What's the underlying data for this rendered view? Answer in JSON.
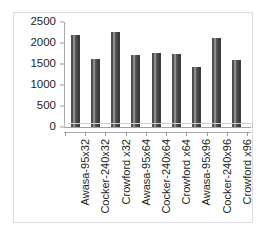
{
  "title_remnant": "",
  "chart_data": {
    "type": "bar",
    "title": "",
    "xlabel": "",
    "ylabel": "",
    "ylim": [
      0,
      2500
    ],
    "yticks": [
      0,
      500,
      1000,
      1500,
      2000,
      2500
    ],
    "ytick_labels": [
      "0",
      "500",
      "1000",
      "1500",
      "2000",
      "2500"
    ],
    "grid": false,
    "legend": "none",
    "bar_color": "#4f4f4f",
    "categories": [
      "Awasa-95x32",
      "Cocker-240x32",
      "Crowford x32",
      "Awasa-95x64",
      "Cocker-240x64",
      "Crowford x64",
      "Awasa-95x96",
      "Cocker-240x96",
      "Crowford x96"
    ],
    "values": [
      2180,
      1620,
      2260,
      1720,
      1760,
      1730,
      1420,
      2130,
      1590
    ]
  }
}
